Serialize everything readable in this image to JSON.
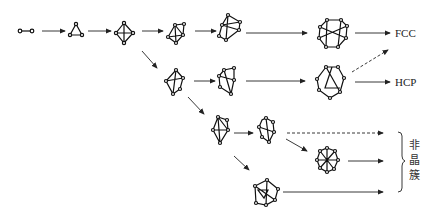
{
  "diagram": {
    "nodes": [
      {
        "id": "dimer",
        "label": ""
      },
      {
        "id": "trimer",
        "label": ""
      },
      {
        "id": "tetra",
        "label": ""
      },
      {
        "id": "c5a",
        "label": ""
      },
      {
        "id": "c6a",
        "label": ""
      },
      {
        "id": "c13fcc",
        "label": ""
      },
      {
        "id": "c5b",
        "label": ""
      },
      {
        "id": "c6b",
        "label": ""
      },
      {
        "id": "c13hcp",
        "label": ""
      },
      {
        "id": "c6c",
        "label": ""
      },
      {
        "id": "c7c",
        "label": ""
      },
      {
        "id": "ico",
        "label": ""
      },
      {
        "id": "c8d",
        "label": ""
      }
    ],
    "outputs": {
      "fcc": "FCC",
      "hcp": "HCP",
      "amorphous": [
        "非",
        "晶",
        "簇"
      ]
    },
    "edges": [
      {
        "from": "dimer",
        "to": "trimer",
        "style": "solid"
      },
      {
        "from": "trimer",
        "to": "tetra",
        "style": "solid"
      },
      {
        "from": "tetra",
        "to": "c5a",
        "style": "solid"
      },
      {
        "from": "c5a",
        "to": "c6a",
        "style": "solid"
      },
      {
        "from": "c6a",
        "to": "c13fcc",
        "style": "solid"
      },
      {
        "from": "c13fcc",
        "to": "FCC",
        "style": "solid"
      },
      {
        "from": "tetra",
        "to": "c5b",
        "style": "solid"
      },
      {
        "from": "c5b",
        "to": "c6b",
        "style": "solid"
      },
      {
        "from": "c6b",
        "to": "c13hcp",
        "style": "solid"
      },
      {
        "from": "c13hcp",
        "to": "HCP",
        "style": "solid"
      },
      {
        "from": "c13hcp",
        "to": "FCC",
        "style": "dashed"
      },
      {
        "from": "c5b",
        "to": "c6c",
        "style": "solid"
      },
      {
        "from": "c6c",
        "to": "c7c",
        "style": "solid"
      },
      {
        "from": "c7c",
        "to": "amorphous",
        "style": "dashed"
      },
      {
        "from": "c7c",
        "to": "ico",
        "style": "solid"
      },
      {
        "from": "ico",
        "to": "amorphous",
        "style": "solid"
      },
      {
        "from": "c6c",
        "to": "c8d",
        "style": "solid"
      },
      {
        "from": "c8d",
        "to": "amorphous",
        "style": "solid"
      }
    ]
  }
}
